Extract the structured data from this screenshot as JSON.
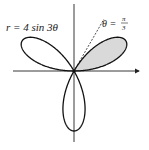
{
  "diagram": {
    "equation_label": "r = 4 sin 3θ",
    "angle_label_prefix": "θ =",
    "angle_num": "π",
    "angle_den": "3",
    "colors": {
      "curve": "#111111",
      "shade": "#d9d9d9",
      "axis": "#222222"
    }
  }
}
